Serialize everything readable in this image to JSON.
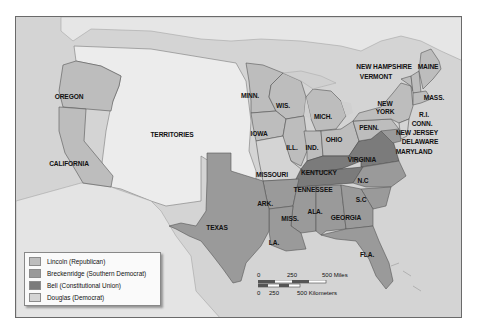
{
  "map": {
    "title": "1860 Presidential Election",
    "colors": {
      "lincoln": "#bdbdbd",
      "breckenridge": "#9a9a9a",
      "bell": "#7b7b7b",
      "douglas": "#cfcfcf",
      "territory": "#ececec",
      "foreign": "#e4e4e4",
      "water": "#d6d6d6"
    },
    "labels": {
      "oregon": "OREGON",
      "california": "CALIFORNIA",
      "territories": "TERRITORIES",
      "texas": "TEXAS",
      "minn": "MINN.",
      "wis": "WIS.",
      "iowa": "IOWA",
      "mich": "MICH.",
      "ill": "ILL.",
      "ind": "IND.",
      "ohio": "OHIO",
      "missouri": "MISSOURI",
      "kentucky": "KENTUCKY",
      "virginia": "VIRGINIA",
      "tennessee": "TENNESSEE",
      "nc": "N.C",
      "sc": "S.C",
      "ark": "ARK.",
      "miss": "MISS.",
      "ala": "ALA.",
      "georgia": "GEORGIA",
      "la": "LA.",
      "fla": "FLA.",
      "penn": "PENN.",
      "new_york_1": "NEW",
      "new_york_2": "YORK",
      "new_hampshire": "NEW HAMPSHIRE",
      "vermont": "VERMONT",
      "maine": "MAINE",
      "mass": "MASS.",
      "ri": "R.I.",
      "conn": "CONN.",
      "new_jersey": "NEW JERSEY",
      "delaware": "DELAWARE",
      "maryland": "MARYLAND"
    }
  },
  "legend": {
    "items": [
      {
        "label": "Lincoln (Republican)",
        "color": "#bdbdbd"
      },
      {
        "label": "Breckenridge (Southern Democrat)",
        "color": "#9a9a9a"
      },
      {
        "label": "Bell (Constitutional Union)",
        "color": "#7b7b7b"
      },
      {
        "label": "Douglas (Democrat)",
        "color": "#d4d4d4"
      }
    ]
  },
  "scale_bar": {
    "miles_0": "0",
    "miles_250": "250",
    "miles_500": "500 Miles",
    "km_0": "0",
    "km_250": "250",
    "km_500": "500 Kilometers"
  }
}
